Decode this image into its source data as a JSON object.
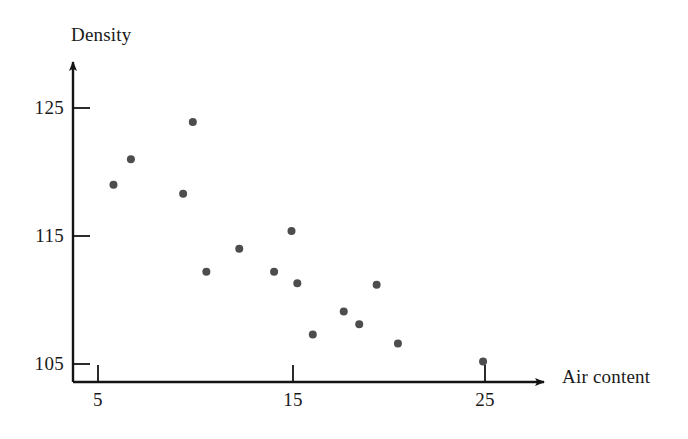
{
  "chart_data": {
    "type": "scatter",
    "title": "",
    "xlabel": "Air content",
    "ylabel": "Density",
    "xticks": [
      5,
      15,
      25
    ],
    "yticks": [
      105,
      115,
      125
    ],
    "xlim": [
      3.0,
      28.3
    ],
    "ylim": [
      103.5,
      126.3
    ],
    "grid": false,
    "legend": "none",
    "marker": {
      "shape": "circle",
      "color": "#4d4d4f",
      "size_px": 8
    },
    "series": [
      {
        "name": "observations",
        "points": [
          {
            "x": 9.9,
            "y": 123.9
          },
          {
            "x": 6.7,
            "y": 121.0
          },
          {
            "x": 5.8,
            "y": 119.0
          },
          {
            "x": 9.4,
            "y": 118.3
          },
          {
            "x": 15.0,
            "y": 115.4
          },
          {
            "x": 12.3,
            "y": 114.0
          },
          {
            "x": 10.6,
            "y": 112.2
          },
          {
            "x": 14.1,
            "y": 112.2
          },
          {
            "x": 15.3,
            "y": 111.3
          },
          {
            "x": 19.4,
            "y": 111.2
          },
          {
            "x": 17.7,
            "y": 109.1
          },
          {
            "x": 18.5,
            "y": 108.1
          },
          {
            "x": 16.1,
            "y": 107.3
          },
          {
            "x": 20.5,
            "y": 106.6
          },
          {
            "x": 24.9,
            "y": 105.2
          }
        ]
      }
    ]
  },
  "axes": {
    "x_title": "Air content",
    "y_title": "Density",
    "x_tick_labels": [
      "5",
      "15",
      "25"
    ],
    "y_tick_labels": [
      "125",
      "115",
      "105"
    ],
    "axis_color": "#141414",
    "arrow_heads": [
      "x-right",
      "y-up"
    ]
  }
}
